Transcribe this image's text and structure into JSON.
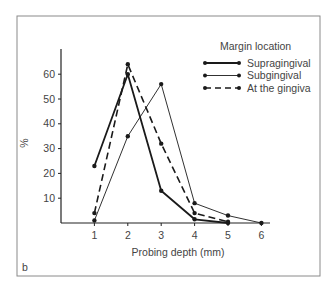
{
  "chart_data": {
    "type": "line",
    "title": "",
    "panel_label": "b",
    "xlabel": "Probing depth (mm)",
    "ylabel": "%",
    "xlim": [
      0,
      6.2
    ],
    "ylim": [
      0,
      70
    ],
    "x_ticks": [
      1,
      2,
      3,
      4,
      5,
      6
    ],
    "y_ticks": [
      10,
      20,
      30,
      40,
      50,
      60
    ],
    "grid": false,
    "legend": {
      "title": "Margin location",
      "placement": "top-right"
    },
    "series": [
      {
        "name": "Supragingival",
        "style": "solid-thick",
        "x": [
          1,
          2,
          3,
          4,
          5
        ],
        "values": [
          23,
          60,
          13,
          1.5,
          0
        ]
      },
      {
        "name": "Subgingival",
        "style": "solid-thin",
        "x": [
          1,
          2,
          3,
          4,
          5,
          6
        ],
        "values": [
          1,
          35,
          56,
          8,
          3,
          0
        ]
      },
      {
        "name": "At the gingiva",
        "style": "dashed",
        "x": [
          1,
          2,
          3,
          4,
          5
        ],
        "values": [
          4,
          64,
          32,
          4,
          0.5
        ]
      }
    ],
    "colors": {
      "line": "#1a1a1a",
      "axis": "#222222",
      "frame": "#8a8a8a",
      "text": "#444444"
    }
  }
}
